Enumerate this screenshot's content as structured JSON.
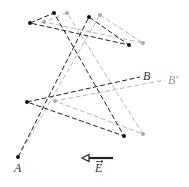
{
  "diagram": {
    "colors": {
      "dark_path": "#222222",
      "light_path": "#b8b8b8",
      "arrow": "#222222"
    },
    "dark_path": {
      "start_label": "A",
      "end_label": "B",
      "points": [
        [
          18,
          157
        ],
        [
          89,
          17
        ],
        [
          129,
          45
        ],
        [
          30,
          23
        ],
        [
          54,
          13
        ],
        [
          124,
          136
        ],
        [
          27,
          102
        ],
        [
          140,
          77
        ]
      ]
    },
    "light_path": {
      "start_label": "A",
      "end_label": "B'",
      "points": [
        [
          18,
          157
        ],
        [
          100,
          15
        ],
        [
          143,
          43
        ],
        [
          44,
          22
        ],
        [
          67,
          13
        ],
        [
          143,
          134
        ],
        [
          55,
          101
        ],
        [
          165,
          80
        ]
      ]
    },
    "labels": {
      "A": "A",
      "B": "B",
      "B_prime": "B'",
      "E": "E"
    },
    "field_arrow": {
      "from": [
        113,
        158
      ],
      "to": [
        82,
        158
      ],
      "label": "E",
      "direction": "left"
    }
  }
}
